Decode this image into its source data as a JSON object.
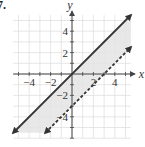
{
  "problem_number": "7.",
  "chart_data": {
    "type": "line",
    "title": "",
    "xlabel": "x",
    "ylabel": "y",
    "xlim": [
      -5.5,
      5.5
    ],
    "ylim": [
      -6,
      5.5
    ],
    "grid": true,
    "x_ticks": [
      -4,
      -2,
      2,
      4
    ],
    "y_ticks": [
      4,
      2,
      -2,
      -4
    ],
    "series": [
      {
        "name": "boundary-solid",
        "equation": "y = x",
        "slope": 1,
        "intercept": 0,
        "style": "solid",
        "x_range": [
          -5.5,
          5.5
        ]
      },
      {
        "name": "boundary-dashed",
        "equation": "y = x - 3",
        "slope": 1,
        "intercept": -3,
        "style": "dashed",
        "x_range": [
          -2.5,
          5.5
        ]
      }
    ],
    "shaded_region": "x - 3 < y <= x",
    "colors": {
      "line": "#333333",
      "shade": "#e4e4e4",
      "grid": "#e0e0e0",
      "axis": "#444444"
    }
  }
}
